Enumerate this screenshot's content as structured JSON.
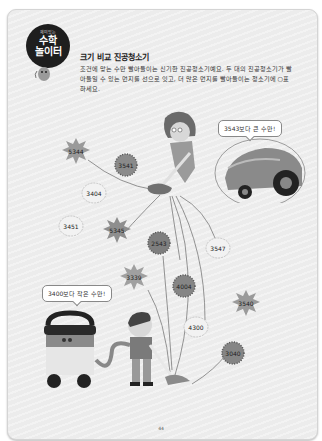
{
  "header": {
    "badge_small": "재미있는",
    "badge_line1": "수학",
    "badge_line2": "놀이터",
    "title": "크기 비교 진공청소기",
    "description": "조건에 맞는 수만 빨아들이는 신기한 진공청소기예요. 두 대의 진공청소기가 빨아들일 수 있는 먼지를 선으로 잇고, 더 많은 먼지를 빨아들이는 청소기에 ○표 하세요."
  },
  "vacuums": {
    "top_bubble": "3543보다 큰 수만!",
    "bottom_bubble": "3400보다 작은 수만!"
  },
  "dust": [
    {
      "value": "5344",
      "shape": "spiky",
      "fill": "#9a9a9a"
    },
    {
      "value": "3541",
      "shape": "round-spiky",
      "fill": "#8a8a8a"
    },
    {
      "value": "3404",
      "shape": "fluffy",
      "fill": "#f2f2f2"
    },
    {
      "value": "3451",
      "shape": "fluffy",
      "fill": "#f2f2f2"
    },
    {
      "value": "5345",
      "shape": "spiky",
      "fill": "#8e8e8e"
    },
    {
      "value": "2543",
      "shape": "round-spiky",
      "fill": "#7e7e7e"
    },
    {
      "value": "3547",
      "shape": "fluffy",
      "fill": "#f2f2f2"
    },
    {
      "value": "3339",
      "shape": "spiky",
      "fill": "#a0a0a0"
    },
    {
      "value": "4004",
      "shape": "round-spiky",
      "fill": "#858585"
    },
    {
      "value": "3540",
      "shape": "spiky",
      "fill": "#9a9a9a"
    },
    {
      "value": "4300",
      "shape": "fluffy",
      "fill": "#f2f2f2"
    },
    {
      "value": "3040",
      "shape": "round-spiky",
      "fill": "#858585"
    }
  ],
  "footer": {
    "page_number": "44"
  }
}
